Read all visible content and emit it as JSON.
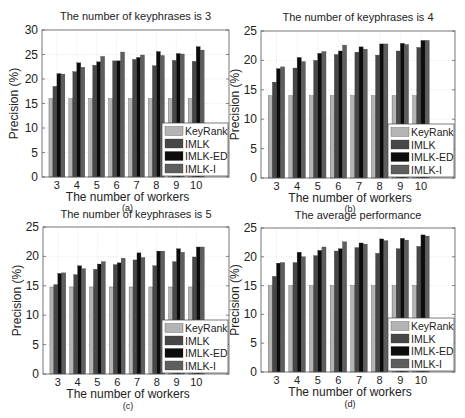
{
  "figure": {
    "width": 465,
    "height": 418
  },
  "colors": {
    "KeyRank": "#b4b4b4",
    "IMLK": "#474747",
    "IMLK-ED": "#0c0c0c",
    "IMLK-I": "#5e5e5e",
    "grid": "#d8d8d8",
    "axis": "#555555"
  },
  "chart_data": [
    {
      "id": "a",
      "type": "bar",
      "title": "The number of keyphrases is 3",
      "xlabel": "The number of workers",
      "ylabel": "Precision (%)",
      "caption": "(a)",
      "categories": [
        "3",
        "4",
        "5",
        "6",
        "7",
        "8",
        "9",
        "10"
      ],
      "ylim": [
        0,
        30
      ],
      "yticks": [
        0,
        5,
        10,
        15,
        20,
        25,
        30
      ],
      "grid": true,
      "legend_position": "lower right",
      "series": [
        {
          "name": "KeyRank",
          "values": [
            16.0,
            16.0,
            16.0,
            16.0,
            16.0,
            16.0,
            16.0,
            16.0
          ]
        },
        {
          "name": "IMLK",
          "values": [
            18.5,
            21.5,
            22.8,
            23.7,
            24.0,
            22.7,
            23.8,
            23.6
          ]
        },
        {
          "name": "IMLK-ED",
          "values": [
            21.1,
            23.3,
            23.5,
            23.7,
            24.4,
            25.6,
            25.2,
            26.6
          ]
        },
        {
          "name": "IMLK-I",
          "values": [
            21.0,
            22.4,
            24.6,
            25.5,
            24.9,
            24.8,
            25.1,
            25.9
          ]
        }
      ]
    },
    {
      "id": "b",
      "type": "bar",
      "title": "The number of keyphrases is 4",
      "xlabel": "The number of workers",
      "ylabel": "Precision (%)",
      "caption": "(b)",
      "categories": [
        "3",
        "4",
        "5",
        "6",
        "7",
        "8",
        "9",
        "10"
      ],
      "ylim": [
        0,
        25
      ],
      "yticks": [
        0,
        5,
        10,
        15,
        20,
        25
      ],
      "grid": true,
      "legend_position": "lower right",
      "series": [
        {
          "name": "KeyRank",
          "values": [
            14.0,
            14.0,
            14.0,
            14.0,
            14.0,
            14.0,
            14.0,
            14.0
          ]
        },
        {
          "name": "IMLK",
          "values": [
            16.3,
            18.7,
            20.0,
            21.0,
            21.4,
            20.9,
            21.6,
            22.2
          ]
        },
        {
          "name": "IMLK-ED",
          "values": [
            18.6,
            20.5,
            21.2,
            21.6,
            22.3,
            22.8,
            22.9,
            23.4
          ]
        },
        {
          "name": "IMLK-I",
          "values": [
            18.9,
            19.8,
            21.5,
            22.6,
            21.9,
            22.8,
            22.7,
            23.4
          ]
        }
      ]
    },
    {
      "id": "c",
      "type": "bar",
      "title": "The number of keyphrases is 5",
      "xlabel": "The number of workers",
      "ylabel": "Precision (%)",
      "caption": "(c)",
      "categories": [
        "3",
        "4",
        "5",
        "6",
        "7",
        "8",
        "9",
        "10"
      ],
      "ylim": [
        0,
        25
      ],
      "yticks": [
        0,
        5,
        10,
        15,
        20,
        25
      ],
      "grid": true,
      "legend_position": "lower right",
      "series": [
        {
          "name": "KeyRank",
          "values": [
            14.8,
            14.8,
            14.8,
            14.8,
            14.8,
            14.8,
            14.8,
            14.8
          ]
        },
        {
          "name": "IMLK",
          "values": [
            15.2,
            16.9,
            17.8,
            18.6,
            19.4,
            18.4,
            19.1,
            19.9
          ]
        },
        {
          "name": "IMLK-ED",
          "values": [
            17.1,
            18.4,
            18.7,
            18.9,
            20.6,
            20.9,
            21.3,
            21.6
          ]
        },
        {
          "name": "IMLK-I",
          "values": [
            17.2,
            17.9,
            19.1,
            19.7,
            19.8,
            20.9,
            20.7,
            21.6
          ]
        }
      ]
    },
    {
      "id": "d",
      "type": "bar",
      "title": "The average performance",
      "xlabel": "The number of workers",
      "ylabel": "Precision (%)",
      "caption": "(d)",
      "categories": [
        "3",
        "4",
        "5",
        "6",
        "7",
        "8",
        "9",
        "10"
      ],
      "ylim": [
        0,
        25
      ],
      "yticks": [
        0,
        5,
        10,
        15,
        20,
        25
      ],
      "grid": true,
      "legend_position": "lower right",
      "series": [
        {
          "name": "KeyRank",
          "values": [
            15.0,
            15.0,
            15.0,
            15.0,
            15.0,
            15.0,
            15.0,
            15.0
          ]
        },
        {
          "name": "IMLK",
          "values": [
            16.6,
            19.0,
            20.2,
            21.0,
            21.6,
            20.6,
            21.4,
            21.8
          ]
        },
        {
          "name": "IMLK-ED",
          "values": [
            18.9,
            20.8,
            21.1,
            21.4,
            22.4,
            23.1,
            23.2,
            23.8
          ]
        },
        {
          "name": "IMLK-I",
          "values": [
            19.0,
            20.0,
            21.7,
            22.6,
            22.2,
            22.8,
            22.9,
            23.6
          ]
        }
      ]
    }
  ],
  "layout": [
    {
      "left": 42,
      "top": 30,
      "right": 229,
      "bottom": 177,
      "title_y": 20,
      "xtick_y": 189,
      "xlabel_y": 201,
      "caption_y": 211,
      "ylabel_x": 18
    },
    {
      "left": 261,
      "top": 31,
      "right": 455,
      "bottom": 178,
      "title_y": 21,
      "xtick_y": 190,
      "xlabel_y": 202,
      "caption_y": 212,
      "ylabel_x": 239
    },
    {
      "left": 43,
      "top": 227,
      "right": 229,
      "bottom": 374,
      "title_y": 218,
      "xtick_y": 386,
      "xlabel_y": 398,
      "caption_y": 409,
      "ylabel_x": 21
    },
    {
      "left": 261,
      "top": 228,
      "right": 455,
      "bottom": 372,
      "title_y": 219,
      "xtick_y": 384,
      "xlabel_y": 396,
      "caption_y": 407,
      "ylabel_x": 239
    }
  ]
}
